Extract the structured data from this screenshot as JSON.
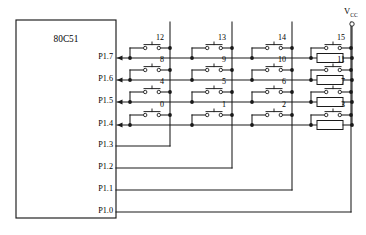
{
  "diagram": {
    "title_chip": "80C51",
    "supply_label": "V",
    "supply_sub": "CC"
  },
  "chip": {
    "label": "80C51",
    "pins_input": [
      {
        "name": "P1.7"
      },
      {
        "name": "P1.6"
      },
      {
        "name": "P1.5"
      },
      {
        "name": "P1.4"
      }
    ],
    "pins_output": [
      {
        "name": "P1.3"
      },
      {
        "name": "P1.2"
      },
      {
        "name": "P1.1"
      },
      {
        "name": "P1.0"
      }
    ]
  },
  "keypad": {
    "rows": [
      {
        "pin": "P1.7",
        "keys": [
          "12",
          "13",
          "14",
          "15"
        ]
      },
      {
        "pin": "P1.6",
        "keys": [
          "8",
          "9",
          "10",
          "11"
        ]
      },
      {
        "pin": "P1.5",
        "keys": [
          "4",
          "5",
          "6",
          "7"
        ]
      },
      {
        "pin": "P1.4",
        "keys": [
          "0",
          "1",
          "2",
          "3"
        ]
      }
    ],
    "columns": [
      "P1.3",
      "P1.2",
      "P1.1",
      "P1.0"
    ]
  },
  "resistors": [
    {
      "connects_row": "P1.7"
    },
    {
      "connects_row": "P1.6"
    },
    {
      "connects_row": "P1.5"
    },
    {
      "connects_row": "P1.4"
    }
  ],
  "geometry": {
    "chip": {
      "x": 16,
      "y": 20,
      "w": 100,
      "h": 198
    },
    "row_y": [
      58,
      80,
      102,
      125
    ],
    "sw_y": [
      48,
      70,
      92,
      115
    ],
    "col_x": [
      170,
      232,
      292,
      351
    ],
    "col_drop_y": [
      146,
      168,
      190,
      212
    ],
    "pin_out_y": [
      146,
      168,
      190,
      212
    ],
    "res_x": 317,
    "res_w": 26,
    "res_h": 9,
    "vcc_x": 352
  }
}
